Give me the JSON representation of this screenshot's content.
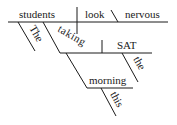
{
  "diagram": {
    "type": "sentence-diagram",
    "sentence_words": [
      "The",
      "students",
      "taking",
      "the",
      "SAT",
      "this",
      "morning",
      "look",
      "nervous"
    ],
    "subject": "students",
    "verb": "look",
    "predicate_adjective": "nervous",
    "modifiers": {
      "subject_article": "The",
      "participle": "taking",
      "participle_object": "SAT",
      "object_article": "the",
      "adverbial_noun": "morning",
      "adverbial_determiner": "this"
    }
  }
}
